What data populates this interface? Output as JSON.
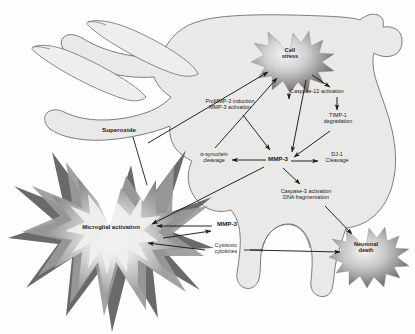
{
  "figure": {
    "kind": "biological-pathway-diagram",
    "background": "#ffffff"
  },
  "palette": {
    "cell_fill": "#e9e9e7",
    "cell_stroke": "#6f6f6f",
    "star_core": "#f2f2f2",
    "star_mid": "#b9b9b9",
    "star_dark": "#6a6a6a",
    "microglia_dark": "#5f5f5f",
    "microglia_mid": "#9a9a9a",
    "microglia_light": "#d6d6d4",
    "arrow": "#1a1a1a",
    "text": "#1a1a1a"
  },
  "nodes": [
    {
      "id": "cell-stress",
      "label": "Cell\nstress",
      "type": "starburst",
      "x": 289,
      "y": 57
    },
    {
      "id": "microglial-activation",
      "label": "Microglial activation",
      "type": "starburst",
      "x": 110,
      "y": 228
    },
    {
      "id": "neuronal-death",
      "label": "Neuronal\ndeath",
      "type": "starburst",
      "x": 365,
      "y": 251
    }
  ],
  "labels": [
    {
      "id": "superoxide",
      "text": "Superoxide",
      "bold": true,
      "x": 118,
      "y": 131
    },
    {
      "id": "prommp3",
      "text": "ProMMP-3 induction\nMMP-3 activation",
      "bold": false,
      "x": 229,
      "y": 104
    },
    {
      "id": "caspase12",
      "text": "Caspase-12 activation",
      "bold": false,
      "x": 316,
      "y": 91
    },
    {
      "id": "timp1",
      "text": "TIMP-1\ndegradation",
      "bold": false,
      "x": 337,
      "y": 118
    },
    {
      "id": "alpha-synuclein",
      "text": "α-synuclein\ncleavage",
      "bold": false,
      "x": 213,
      "y": 157
    },
    {
      "id": "mmp3-center",
      "text": "MMP-3",
      "bold": true,
      "x": 277,
      "y": 160
    },
    {
      "id": "dj1",
      "text": "DJ-1\nCleavage",
      "bold": false,
      "x": 337,
      "y": 157
    },
    {
      "id": "caspase3",
      "text": "Caspase-3 activation\nDNA fragmentation",
      "bold": false,
      "x": 306,
      "y": 194
    },
    {
      "id": "mmp3-microglia",
      "text": "MMP-3",
      "bold": true,
      "x": 227,
      "y": 224
    },
    {
      "id": "cytotoxic",
      "text": "Cytotoxic\ncytokines",
      "bold": false,
      "x": 227,
      "y": 248
    }
  ],
  "edges": [
    {
      "from": "superoxide",
      "to": "cell-stress",
      "style": "solid-arrow"
    },
    {
      "from": "microglial-activation",
      "to": "cell-stress",
      "style": "solid-arrow"
    },
    {
      "from": "alpha-synuclein",
      "to": "cell-stress",
      "style": "solid-arrow"
    },
    {
      "from": "cell-stress",
      "to": "prommp3",
      "style": "solid-arrow"
    },
    {
      "from": "cell-stress",
      "to": "caspase12",
      "style": "solid-arrow"
    },
    {
      "from": "cell-stress",
      "to": "mmp3-center",
      "style": "solid-arrow"
    },
    {
      "from": "caspase12",
      "to": "timp1",
      "style": "solid-arrow"
    },
    {
      "from": "timp1",
      "to": "mmp3-center",
      "style": "solid-arrow"
    },
    {
      "from": "prommp3",
      "to": "mmp3-center",
      "style": "solid-arrow"
    },
    {
      "from": "mmp3-center",
      "to": "alpha-synuclein",
      "style": "solid-arrow"
    },
    {
      "from": "mmp3-center",
      "to": "dj1",
      "style": "solid-arrow"
    },
    {
      "from": "mmp3-center",
      "to": "caspase3",
      "style": "solid-arrow"
    },
    {
      "from": "mmp3-center",
      "to": "microglial-activation",
      "style": "solid-arrow"
    },
    {
      "from": "caspase3",
      "to": "neuronal-death",
      "style": "solid-arrow"
    },
    {
      "from": "mmp3-microglia",
      "to": "microglial-activation",
      "style": "solid-arrow"
    },
    {
      "from": "cytotoxic",
      "to": "microglial-activation",
      "style": "solid-arrow"
    },
    {
      "from": "cytotoxic",
      "to": "neuronal-death",
      "style": "solid-arrow"
    },
    {
      "from": "microglial-activation",
      "to": "mmp3-microglia",
      "style": "solid-arrow"
    }
  ]
}
